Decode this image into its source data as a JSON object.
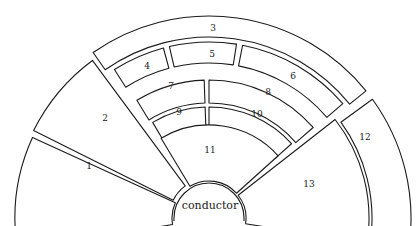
{
  "diagram": {
    "center_label": "conductor",
    "stroke_color": "#1a1a1a",
    "fill_color": "#ffffff",
    "sections": [
      {
        "id": "1",
        "label": "1"
      },
      {
        "id": "2",
        "label": "2"
      },
      {
        "id": "3",
        "label": "3"
      },
      {
        "id": "4",
        "label": "4"
      },
      {
        "id": "5",
        "label": "5"
      },
      {
        "id": "6",
        "label": "6"
      },
      {
        "id": "7",
        "label": "7"
      },
      {
        "id": "8",
        "label": "8"
      },
      {
        "id": "9",
        "label": "9"
      },
      {
        "id": "10",
        "label": "10"
      },
      {
        "id": "11",
        "label": "11"
      },
      {
        "id": "12",
        "label": "12"
      },
      {
        "id": "13",
        "label": "13"
      }
    ]
  }
}
